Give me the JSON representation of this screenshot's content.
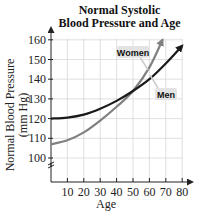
{
  "chart_data": {
    "type": "line",
    "title": "Normal Systolic Blood Pressure and Age",
    "title_lines": [
      "Normal Systolic",
      "Blood Pressure and Age"
    ],
    "xlabel": "Age",
    "ylabel": "Normal Blood Pressure (mm Hg)",
    "ylabel_lines": [
      "Normal Blood Pressure",
      "(mm Hg)"
    ],
    "xlim": [
      0,
      80
    ],
    "ylim": [
      100,
      160
    ],
    "xticks": [
      10,
      20,
      30,
      40,
      50,
      60,
      70,
      80
    ],
    "yticks": [
      100,
      110,
      120,
      130,
      140,
      150,
      160
    ],
    "grid": true,
    "axis_break": "y",
    "series": [
      {
        "name": "Women",
        "x": [
          0,
          10,
          20,
          30,
          40,
          50,
          60,
          68
        ],
        "y": [
          107,
          109,
          113,
          119,
          126,
          134,
          146,
          160
        ],
        "color": "#808080"
      },
      {
        "name": "Men",
        "x": [
          0,
          10,
          20,
          30,
          40,
          50,
          60,
          70,
          80
        ],
        "y": [
          120,
          120.5,
          122,
          125,
          129,
          134,
          140,
          148,
          157
        ],
        "color": "#1a1a1a"
      }
    ],
    "legend": [
      "Women",
      "Men"
    ],
    "legend_position": "inline labels"
  }
}
